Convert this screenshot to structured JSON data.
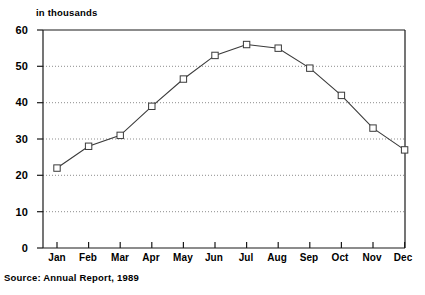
{
  "chart_data": {
    "type": "line",
    "title": "",
    "axis_note": "in thousands",
    "categories": [
      "Jan",
      "Feb",
      "Mar",
      "Apr",
      "May",
      "Jun",
      "Jul",
      "Aug",
      "Sep",
      "Oct",
      "Nov",
      "Dec"
    ],
    "values": [
      22,
      28,
      31,
      39,
      46.5,
      53,
      56,
      55,
      49.5,
      42,
      33,
      27
    ],
    "series": [
      {
        "name": "monthly value",
        "values": [
          22,
          28,
          31,
          39,
          46.5,
          53,
          56,
          55,
          49.5,
          42,
          33,
          27
        ]
      }
    ],
    "xlabel": "",
    "ylabel": "in thousands",
    "ylim": [
      0,
      60
    ],
    "yticks": [
      0,
      10,
      20,
      30,
      40,
      50,
      60
    ],
    "ytick_labels": [
      "0",
      "10",
      "20",
      "30",
      "40",
      "50",
      "60"
    ],
    "grid": true,
    "grid_style": "dotted-horizontal",
    "legend": "none",
    "marker": "open-square",
    "line_color": "#3a3a3a",
    "grid_color": "#9a9a9a",
    "axis_color": "#1a1a1a",
    "source": "Source:  Annual Report, 1989"
  },
  "footer": {
    "source_text": "Source:  Annual Report, 1989"
  }
}
